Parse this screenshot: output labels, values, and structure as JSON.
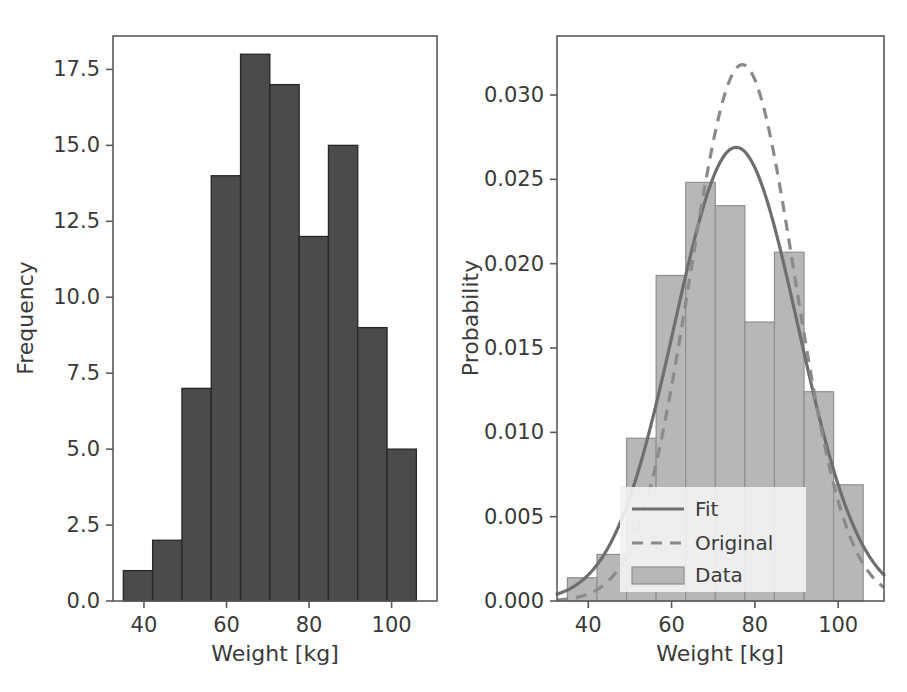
{
  "figure": {
    "background": "#ffffff",
    "width": 907,
    "height": 692,
    "panels": 2
  },
  "chart_data": [
    {
      "id": "left-histogram",
      "type": "bar",
      "title": "",
      "xlabel": "Weight [kg]",
      "ylabel": "Frequency",
      "xlim": [
        32.5,
        111.0
      ],
      "ylim": [
        0.0,
        18.6
      ],
      "xticks": [
        40,
        60,
        80,
        100
      ],
      "xtick_labels": [
        "40",
        "60",
        "80",
        "100"
      ],
      "yticks": [
        0.0,
        2.5,
        5.0,
        7.5,
        10.0,
        12.5,
        15.0,
        17.5
      ],
      "ytick_labels": [
        "0.0",
        "2.5",
        "5.0",
        "7.5",
        "10.0",
        "12.5",
        "15.0",
        "17.5"
      ],
      "grid": false,
      "bar_color": "#4b4b4b",
      "bar_edge_color": "#262626",
      "bin_edges": [
        35.0,
        42.1,
        49.2,
        56.3,
        63.4,
        70.5,
        77.6,
        84.7,
        91.8,
        98.9,
        106.0
      ],
      "categories": [
        "35.0-42.1",
        "42.1-49.2",
        "49.2-56.3",
        "56.3-63.4",
        "63.4-70.5",
        "70.5-77.6",
        "77.6-84.7",
        "84.7-91.8",
        "91.8-98.9",
        "98.9-106.0"
      ],
      "values": [
        1,
        2,
        7,
        14,
        18,
        17,
        12,
        15,
        9,
        5
      ]
    },
    {
      "id": "right-density",
      "type": "bar",
      "title": "",
      "xlabel": "Weight [kg]",
      "ylabel": "Probability",
      "xlim": [
        32.5,
        111.0
      ],
      "ylim": [
        0.0,
        0.0335
      ],
      "xticks": [
        40,
        60,
        80,
        100
      ],
      "xtick_labels": [
        "40",
        "60",
        "80",
        "100"
      ],
      "yticks": [
        0.0,
        0.005,
        0.01,
        0.015,
        0.02,
        0.025,
        0.03
      ],
      "ytick_labels": [
        "0.000",
        "0.005",
        "0.010",
        "0.015",
        "0.020",
        "0.025",
        "0.030"
      ],
      "grid": false,
      "bar_color": "#b7b7b7",
      "bar_edge_color": "#8f8f8f",
      "bin_edges": [
        35.0,
        42.1,
        49.2,
        56.3,
        63.4,
        70.5,
        77.6,
        84.7,
        91.8,
        98.9,
        106.0
      ],
      "categories": [
        "35.0-42.1",
        "42.1-49.2",
        "49.2-56.3",
        "56.3-63.4",
        "63.4-70.5",
        "70.5-77.6",
        "77.6-84.7",
        "84.7-91.8",
        "91.8-98.9",
        "98.9-106.0"
      ],
      "values": [
        0.00138,
        0.00276,
        0.00965,
        0.0193,
        0.02482,
        0.02344,
        0.01654,
        0.02068,
        0.01241,
        0.00689
      ],
      "series": [
        {
          "name": "Fit",
          "type": "line",
          "style": "solid",
          "color": "#6e6e6e",
          "distribution": "normal",
          "mean": 75.5,
          "sigma": 14.85,
          "peak_value": 0.0269
        },
        {
          "name": "Original",
          "type": "line",
          "style": "dashed",
          "color": "#8a8a8a",
          "distribution": "normal",
          "mean": 77.0,
          "sigma": 12.55,
          "peak_value": 0.0318
        }
      ],
      "legend": {
        "position": "lower center",
        "entries": [
          {
            "label": "Fit",
            "marker": "solid-line",
            "color": "#6e6e6e"
          },
          {
            "label": "Original",
            "marker": "dashed-line",
            "color": "#8a8a8a"
          },
          {
            "label": "Data",
            "marker": "patch",
            "color": "#b7b7b7"
          }
        ]
      }
    }
  ]
}
